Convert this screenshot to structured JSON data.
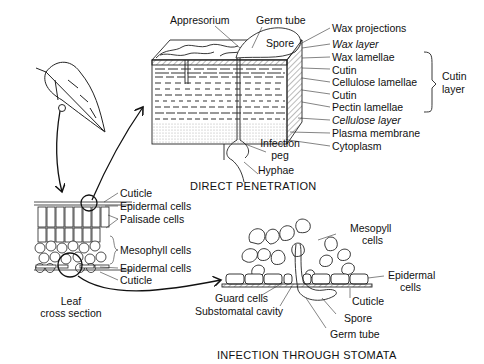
{
  "direct_penetration": {
    "title": "DIRECT PENETRATION",
    "labels": {
      "appresorium": "Appresorium",
      "germ_tube": "Germ tube",
      "spore": "Spore",
      "wax_projections": "Wax projections",
      "wax_layer": "Wax layer",
      "wax_lamellae": "Wax lamellae",
      "cutin_1": "Cutin",
      "cellulose_lamellae": "Cellulose lamellae",
      "cutin_2": "Cutin",
      "pectin_lamellae": "Pectin lamellae",
      "cellulose_layer": "Cellulose layer",
      "plasma_membrane": "Plasma membrane",
      "cytoplasm": "Cytoplasm",
      "infection_peg_1": "Infection",
      "infection_peg_2": "peg",
      "hyphae": "Hyphae",
      "cutin_layer_1": "Cutin",
      "cutin_layer_2": "layer"
    }
  },
  "leaf_section": {
    "caption_1": "Leaf",
    "caption_2": "cross section",
    "labels": {
      "cuticle_top": "Cuticle",
      "epidermal_top": "Epidermal cells",
      "palisade": "Palisade cells",
      "mesophyll": "Mesophyll cells",
      "epidermal_bottom": "Epidermal cells",
      "cuticle_bottom": "Cuticle"
    }
  },
  "stomata": {
    "title": "INFECTION THROUGH STOMATA",
    "labels": {
      "mesophyll_1": "Mesopyll",
      "mesophyll_2": "cells",
      "epidermal_1": "Epidermal",
      "epidermal_2": "cells",
      "guard_cells": "Guard cells",
      "substomatal": "Substomatal cavity",
      "cuticle": "Cuticle",
      "spore": "Spore",
      "germ_tube": "Germ tube"
    }
  }
}
